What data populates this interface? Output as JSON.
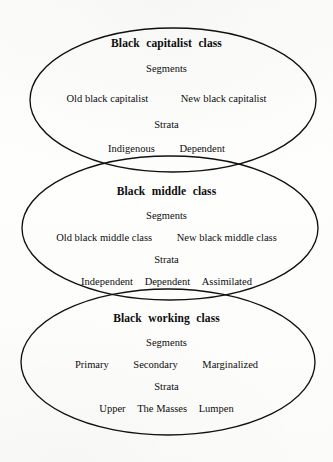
{
  "figure": {
    "kind": "venn-chain-diagram",
    "stroke_color": "#111111",
    "background_color": "#fdfdfc",
    "headings": {
      "segments": "Segments",
      "strata": "Strata"
    }
  },
  "groups": [
    {
      "id": "black-capitalist-class",
      "title": "Black capitalist class",
      "segments_label": "Segments",
      "segments": [
        "Old black capitalist",
        "New black capitalist"
      ],
      "strata_label": "Strata",
      "strata": [
        "Indigenous",
        "Dependent"
      ],
      "ellipse": {
        "cx": 173,
        "cy": 100,
        "rx": 143,
        "ry": 72
      }
    },
    {
      "id": "black-middle-class",
      "title": "Black middle class",
      "segments_label": "Segments",
      "segments": [
        "Old black middle class",
        "New black middle class"
      ],
      "strata_label": "Strata",
      "strata": [
        "Independent",
        "Dependent",
        "Assimilated"
      ],
      "ellipse": {
        "cx": 170,
        "cy": 228,
        "rx": 148,
        "ry": 72
      }
    },
    {
      "id": "black-working-class",
      "title": "Black working class",
      "segments_label": "Segments",
      "segments": [
        "Primary",
        "Secondary",
        "Marginalized"
      ],
      "strata_label": "Strata",
      "strata": [
        "Upper",
        "The Masses",
        "Lumpen"
      ],
      "ellipse": {
        "cx": 168,
        "cy": 362,
        "rx": 147,
        "ry": 73
      }
    }
  ]
}
